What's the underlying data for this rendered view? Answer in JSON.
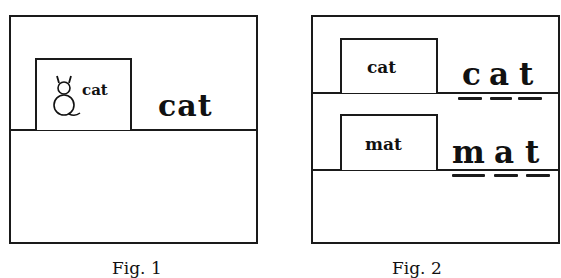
{
  "figures": [
    {
      "caption": "Fig. 1",
      "card": {
        "icon": "cat-drawing-icon",
        "label": "cat"
      },
      "word": "cat"
    },
    {
      "caption": "Fig. 2",
      "rows": [
        {
          "card_label": "cat",
          "word_letters": [
            "c",
            "a",
            "t"
          ]
        },
        {
          "card_label": "mat",
          "word_letters": [
            "m",
            "a",
            "t"
          ]
        }
      ]
    }
  ]
}
